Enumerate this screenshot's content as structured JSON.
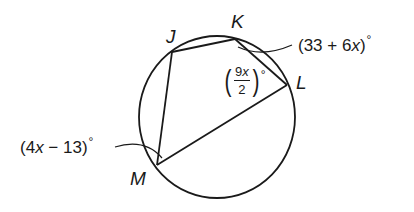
{
  "diagram": {
    "type": "inscribed-quadrilateral",
    "vertices": {
      "J": {
        "label": "J"
      },
      "K": {
        "label": "K"
      },
      "L": {
        "label": "L"
      },
      "M": {
        "label": "M"
      }
    },
    "angles": {
      "K": {
        "expression_prefix": "(33 + 6",
        "variable": "x",
        "expression_suffix": ")",
        "degree": "°",
        "full": "(33 + 6x)°"
      },
      "L": {
        "numerator_coef": "9",
        "variable": "x",
        "denominator": "2",
        "degree": "°",
        "full": "(9x/2)°"
      },
      "M": {
        "expression_prefix": "(4",
        "variable": "x",
        "expression_suffix": " − 13)",
        "degree": "°",
        "full": "(4x − 13)°"
      }
    },
    "colors": {
      "stroke": "#1a1a1a",
      "background": "#ffffff"
    }
  }
}
